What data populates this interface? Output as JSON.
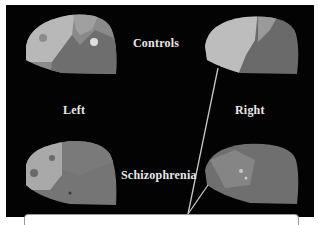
{
  "figure": {
    "labels": {
      "controls": "Controls",
      "schizophrenia": "Schizophrenia",
      "left": "Left",
      "right": "Right"
    },
    "panels": [
      {
        "position": "top-left",
        "group": "Controls",
        "hemisphere": "Left"
      },
      {
        "position": "top-right",
        "group": "Controls",
        "hemisphere": "Right"
      },
      {
        "position": "bottom-left",
        "group": "Schizophrenia",
        "hemisphere": "Left"
      },
      {
        "position": "bottom-right",
        "group": "Schizophrenia",
        "hemisphere": "Right"
      }
    ],
    "colors": {
      "background": "#030303",
      "label": "#e8e8e8",
      "leader_line": "#c8c8c8"
    }
  }
}
